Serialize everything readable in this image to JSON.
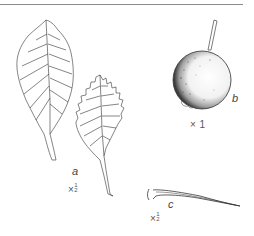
{
  "figure": {
    "specimens": [
      {
        "id": "a",
        "label": "a",
        "subject": "leaves",
        "scale_prefix": "×",
        "scale_num": "1",
        "scale_den": "2"
      },
      {
        "id": "b",
        "label": "b",
        "subject": "fruit",
        "scale_text": "× 1"
      },
      {
        "id": "c",
        "label": "c",
        "subject": "thorn",
        "scale_prefix": "×",
        "scale_num": "1",
        "scale_den": "2"
      }
    ],
    "colors": {
      "ink": "#333333",
      "rule": "#8a8a8a",
      "background": "#ffffff"
    }
  }
}
